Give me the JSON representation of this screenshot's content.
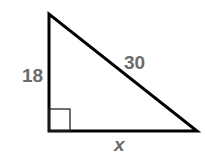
{
  "diagram": {
    "type": "right-triangle",
    "labels": {
      "vertical_leg": "18",
      "hypotenuse": "30",
      "horizontal_leg": "x"
    },
    "colors": {
      "stroke": "#000000",
      "label": "#6b6b6b",
      "background": "#ffffff"
    },
    "right_angle_marker": true
  }
}
